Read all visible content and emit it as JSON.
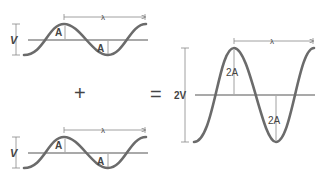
{
  "diagram": {
    "wave1": {
      "amplitude_label": "A",
      "height_label": "V",
      "wavelength_label": "λ"
    },
    "wave2": {
      "amplitude_label": "A",
      "height_label": "V",
      "wavelength_label": "λ"
    },
    "operator_plus": "+",
    "operator_equals": "=",
    "result": {
      "amplitude_label": "2A",
      "height_label": "2V",
      "wavelength_label": "λ"
    },
    "colors": {
      "wave": "#6b6b6b",
      "axis": "#555555",
      "dimension": "#888888"
    }
  }
}
